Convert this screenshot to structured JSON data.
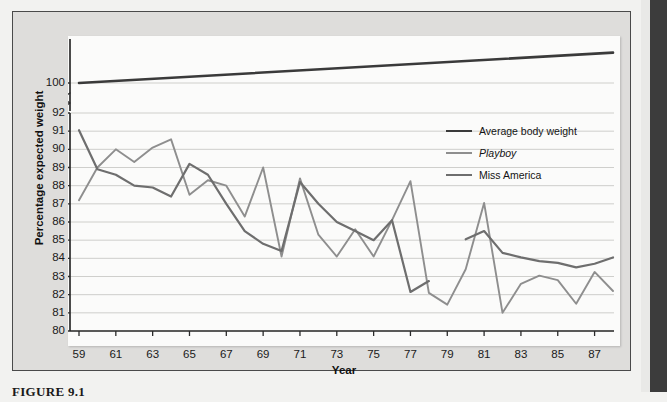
{
  "figure": {
    "caption": "FIGURE 9.1"
  },
  "chart_data": {
    "type": "line",
    "title": "",
    "xlabel": "Year",
    "ylabel": "Percentage expected weight",
    "xlim": [
      59,
      88
    ],
    "ylim": [
      80,
      92
    ],
    "grid": true,
    "axis_break": {
      "present": true,
      "between": [
        92,
        100
      ],
      "symbol": "broken-axis-zigzag"
    },
    "legend_position": "upper-right",
    "x_tick_labels": [
      "59",
      "61",
      "63",
      "65",
      "67",
      "69",
      "71",
      "73",
      "75",
      "77",
      "79",
      "81",
      "83",
      "85",
      "87"
    ],
    "x_tick_values": [
      59,
      61,
      63,
      65,
      67,
      69,
      71,
      73,
      75,
      77,
      79,
      81,
      83,
      85,
      87
    ],
    "y_tick_labels": [
      "80",
      "81",
      "82",
      "83",
      "84",
      "85",
      "86",
      "87",
      "88",
      "89",
      "90",
      "91",
      "92",
      "100"
    ],
    "y_tick_values": [
      80,
      81,
      82,
      83,
      84,
      85,
      86,
      87,
      88,
      89,
      90,
      91,
      92,
      100
    ],
    "series": [
      {
        "name": "Average body weight",
        "color": "#3a3a3a",
        "style": "solid",
        "width": 2.6,
        "x": [
          59,
          88
        ],
        "values": [
          100,
          104.6
        ]
      },
      {
        "name": "Playboy",
        "color": "#8e8e8e",
        "style": "solid",
        "width": 1.9,
        "x": [
          59,
          60,
          61,
          62,
          63,
          64,
          65,
          66,
          67,
          68,
          69,
          70,
          71,
          72,
          73,
          74,
          75,
          76,
          77,
          78,
          79,
          80,
          81,
          82,
          83,
          84,
          85,
          86,
          87,
          88
        ],
        "values": [
          87.2,
          89.0,
          90.0,
          89.3,
          90.1,
          90.55,
          87.5,
          88.3,
          88.0,
          86.3,
          89.0,
          84.1,
          88.4,
          85.3,
          84.1,
          85.6,
          84.1,
          86.1,
          88.25,
          82.1,
          81.45,
          83.4,
          87.05,
          81.0,
          82.6,
          83.05,
          82.8,
          81.5,
          83.25,
          82.2
        ]
      },
      {
        "name": "Miss America",
        "color": "#6e6e6e",
        "style": "solid",
        "width": 2.2,
        "x": [
          59,
          60,
          61,
          62,
          63,
          64,
          65,
          66,
          67,
          68,
          69,
          70,
          71,
          72,
          73,
          74,
          75,
          76,
          77,
          78,
          79,
          80,
          81,
          82,
          83,
          84,
          85,
          86,
          87,
          88
        ],
        "values": [
          91.05,
          88.9,
          88.6,
          88.0,
          87.9,
          87.4,
          89.2,
          88.6,
          87.0,
          85.5,
          84.8,
          84.4,
          88.2,
          87.0,
          86.0,
          85.5,
          85.0,
          86.1,
          82.15,
          82.75,
          null,
          85.05,
          85.5,
          84.3,
          84.05,
          83.85,
          83.75,
          83.5,
          83.7,
          84.05
        ]
      }
    ]
  },
  "legend": {
    "items": [
      {
        "label": "Average body weight",
        "color": "#3a3a3a",
        "italic": false
      },
      {
        "label": "Playboy",
        "color": "#8e8e8e",
        "italic": true
      },
      {
        "label": "Miss America",
        "color": "#6e6e6e",
        "italic": false
      }
    ]
  },
  "colors": {
    "page_background": "#f2f2f0",
    "figure_background": "#dedddb",
    "panel_background": "#fbfbfa",
    "gridline": "#c9c9c6",
    "axis": "#2b2b2b",
    "margin_bar": "#3c3c3c"
  }
}
